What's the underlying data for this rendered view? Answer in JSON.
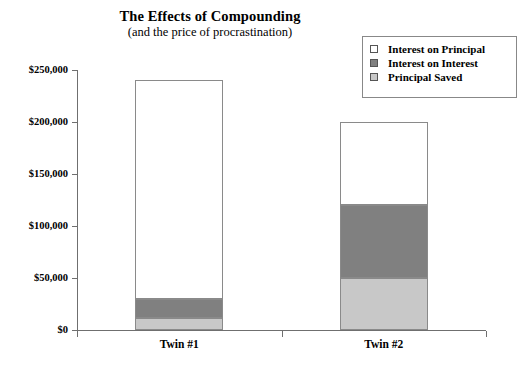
{
  "chart_data": {
    "type": "bar",
    "subtype": "stacked-bar",
    "title": "The Effects of Compounding",
    "subtitle": "(and the price of procrastination)",
    "xlabel": "",
    "ylabel": "",
    "categories": [
      "Twin #1",
      "Twin #2"
    ],
    "series": [
      {
        "name": "Principal Saved",
        "values": [
          12000,
          50000
        ],
        "color": "#c8c8c8"
      },
      {
        "name": "Interest on Interest",
        "values": [
          18000,
          70000
        ],
        "color": "#808080"
      },
      {
        "name": "Interest on Principal",
        "values": [
          210000,
          80000
        ],
        "color": "#ffffff"
      }
    ],
    "totals": [
      240000,
      200000
    ],
    "ylim": [
      0,
      250000
    ],
    "ytick_values": [
      0,
      50000,
      100000,
      150000,
      200000,
      250000
    ],
    "ytick_labels": [
      "$0",
      "$50,000",
      "$100,000",
      "$150,000",
      "$200,000",
      "$250,000"
    ],
    "grid": false,
    "legend_position": "top-right"
  },
  "legend": {
    "items": [
      {
        "label": "Interest on Principal",
        "color": "#ffffff"
      },
      {
        "label": "Interest on Interest",
        "color": "#808080"
      },
      {
        "label": "Principal Saved",
        "color": "#c8c8c8"
      }
    ]
  }
}
